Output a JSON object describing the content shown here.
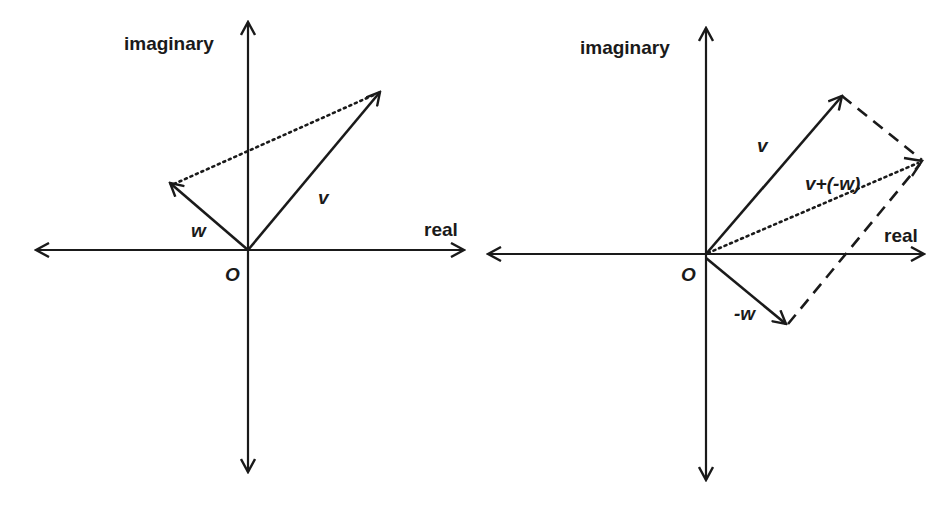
{
  "left_panel": {
    "axis_labels": {
      "imaginary": "imaginary",
      "real": "real",
      "origin": "O"
    },
    "vectors": {
      "v": "v",
      "w": "w"
    }
  },
  "right_panel": {
    "axis_labels": {
      "imaginary": "imaginary",
      "real": "real",
      "origin": "O"
    },
    "vectors": {
      "v": "v",
      "neg_w": "-w",
      "sum": "v+(-w)"
    }
  },
  "colors": {
    "stroke": "#1a1a1a",
    "background": "#ffffff"
  }
}
